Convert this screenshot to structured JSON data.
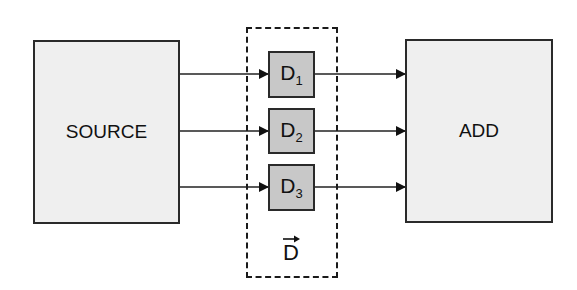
{
  "diagram": {
    "source": {
      "label": "SOURCE"
    },
    "add": {
      "label": "ADD"
    },
    "delays": [
      {
        "base": "D",
        "sub": "1"
      },
      {
        "base": "D",
        "sub": "2"
      },
      {
        "base": "D",
        "sub": "3"
      }
    ],
    "group": {
      "label": "D",
      "vector": true
    },
    "connections": [
      {
        "from": "SOURCE",
        "to": "D1"
      },
      {
        "from": "SOURCE",
        "to": "D2"
      },
      {
        "from": "SOURCE",
        "to": "D3"
      },
      {
        "from": "D1",
        "to": "ADD"
      },
      {
        "from": "D2",
        "to": "ADD"
      },
      {
        "from": "D3",
        "to": "ADD"
      }
    ],
    "colors": {
      "big_block_fill": "#efefef",
      "delay_block_fill": "#c8c8c8",
      "stroke": "#2a2a2a"
    }
  }
}
